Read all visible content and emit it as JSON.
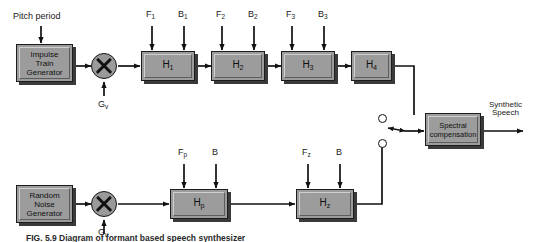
{
  "figure": {
    "caption": "FIG. 5.9   Diagram of formant based speech synthesizer",
    "colors": {
      "block_fill": "#9c9c9c",
      "block_border": "#1d1d1d",
      "line": "#111111",
      "background": "#ffffff",
      "shadow": "#3a3a3a"
    }
  },
  "inputs": {
    "pitch_period": "Pitch period",
    "gain_voiced": "G",
    "gain_voiced_sub": "v",
    "gain_unvoiced": "G",
    "gain_unvoiced_sub": "u"
  },
  "sources": {
    "impulse": {
      "line1": "Impulse",
      "line2": "Train",
      "line3": "Generator"
    },
    "noise": {
      "line1": "Random",
      "line2": "Noise",
      "line3": "Generator"
    }
  },
  "multipliers": [
    {
      "name": "voiced-multiplier",
      "symbol": "X"
    },
    {
      "name": "unvoiced-multiplier",
      "symbol": "X"
    }
  ],
  "formant_params": [
    {
      "freq": "F",
      "freq_sub": "1",
      "bw": "B",
      "bw_sub": "1"
    },
    {
      "freq": "F",
      "freq_sub": "2",
      "bw": "B",
      "bw_sub": "2"
    },
    {
      "freq": "F",
      "freq_sub": "3",
      "bw": "B",
      "bw_sub": "3"
    }
  ],
  "formant_filters": [
    {
      "label": "H",
      "sub": "1"
    },
    {
      "label": "H",
      "sub": "2"
    },
    {
      "label": "H",
      "sub": "3"
    },
    {
      "label": "H",
      "sub": "4"
    }
  ],
  "pole_params": {
    "freq": "F",
    "freq_sub": "p",
    "bw": "B",
    "bw_sub": ""
  },
  "pole_filter": {
    "label": "H",
    "sub": "p"
  },
  "zero_params": {
    "freq": "F",
    "freq_sub": "z",
    "bw": "B",
    "bw_sub": ""
  },
  "zero_filter": {
    "label": "H",
    "sub": "z"
  },
  "switch": {
    "name": "voiced-unvoiced-switch",
    "upper_contact": "voiced",
    "lower_contact": "unvoiced"
  },
  "spectral": {
    "line1": "Spectral",
    "line2": "compensation"
  },
  "output": {
    "line1": "Synthetic",
    "line2": "Speech"
  }
}
